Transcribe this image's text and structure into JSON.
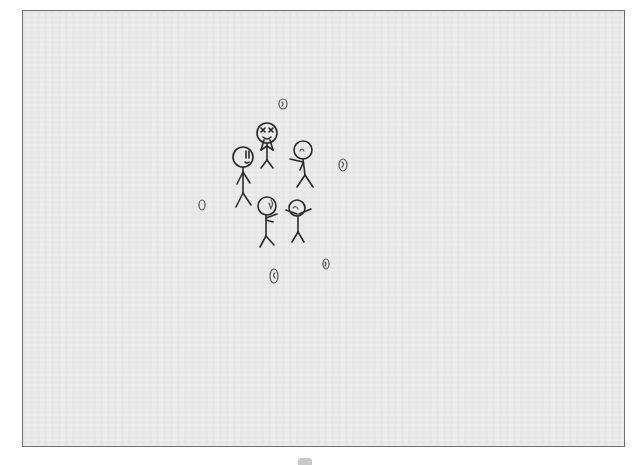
{
  "scene": {
    "description": "Scanned pencil/ink drawing of five stick figures in a cluster surrounded by small oval egg-like shapes",
    "paper_color": "#e9e9e9",
    "border_color": "#6e6e6e",
    "ink_color": "#2a2a2a"
  },
  "figures": [
    {
      "name": "tall-figure",
      "head": [
        243,
        157
      ],
      "r": 10,
      "expression": "wide eyes, open mouth"
    },
    {
      "name": "x-eyes-figure",
      "head": [
        267,
        133
      ],
      "r": 10,
      "expression": "x eyes, hands at mouth"
    },
    {
      "name": "pointing-figure",
      "head": [
        303,
        150
      ],
      "r": 9,
      "expression": "arm pointing left"
    },
    {
      "name": "bottom-left-figure",
      "head": [
        267,
        206
      ],
      "r": 9,
      "expression": "facing right, arms forward"
    },
    {
      "name": "bottom-right-figure",
      "head": [
        297,
        208
      ],
      "r": 8,
      "expression": "arms spread out"
    }
  ],
  "eggs": [
    {
      "cx": 283,
      "cy": 104,
      "rx": 4,
      "ry": 5
    },
    {
      "cx": 343,
      "cy": 165,
      "rx": 4,
      "ry": 6
    },
    {
      "cx": 202,
      "cy": 205,
      "rx": 3,
      "ry": 5
    },
    {
      "cx": 274,
      "cy": 276,
      "rx": 4,
      "ry": 7
    },
    {
      "cx": 326,
      "cy": 264,
      "rx": 3,
      "ry": 5
    }
  ]
}
